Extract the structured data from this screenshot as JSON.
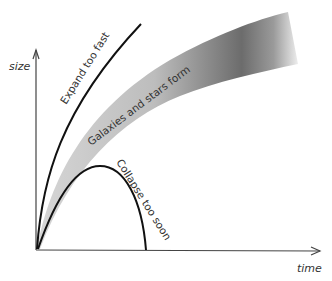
{
  "axes": {
    "y_label": "size",
    "x_label": "time"
  },
  "curves": {
    "expand": {
      "label": "Expand too fast",
      "color": "#111111"
    },
    "galaxies": {
      "label": "Galaxies and stars form",
      "band_light": "#d4d4d4",
      "band_dark": "#6a6a6a"
    },
    "collapse": {
      "label": "Collapse too soon",
      "color": "#111111"
    }
  },
  "colors": {
    "axis": "#444444",
    "background": "#ffffff"
  }
}
